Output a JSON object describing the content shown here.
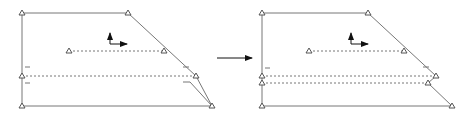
{
  "diagram": {
    "type": "geometry-transformation",
    "colors": {
      "outline": "#777777",
      "dotted": "#777777",
      "arrow": "#111111",
      "marker": "#555555",
      "background": "#ffffff"
    },
    "panels": [
      {
        "name": "before",
        "outline": [
          [
            22,
            13
          ],
          [
            128,
            13
          ],
          [
            196,
            76
          ],
          [
            212,
            106
          ],
          [
            22,
            106
          ],
          [
            22,
            13
          ]
        ],
        "notch": [
          [
            183,
            82
          ],
          [
            190,
            82
          ],
          [
            212,
            106
          ]
        ],
        "dotted_lines": [
          [
            [
              69,
              51
            ],
            [
              164,
              51
            ]
          ],
          [
            [
              22,
              76
            ],
            [
              196,
              76
            ]
          ]
        ],
        "markers": [
          [
            22,
            13
          ],
          [
            128,
            13
          ],
          [
            69,
            51
          ],
          [
            164,
            51
          ],
          [
            22,
            76
          ],
          [
            196,
            76
          ],
          [
            212,
            106
          ],
          [
            22,
            106
          ]
        ],
        "ticks": [
          [
            [
              25,
              67
            ],
            [
              30,
              67
            ]
          ],
          [
            [
              25,
              83
            ],
            [
              30,
              83
            ]
          ],
          [
            [
              183,
              67
            ],
            [
              189,
              67
            ]
          ]
        ],
        "axes_origin": [
          110,
          44
        ]
      },
      {
        "name": "after",
        "outline": [
          [
            262,
            13
          ],
          [
            368,
            13
          ],
          [
            436,
            76
          ],
          [
            428,
            83
          ],
          [
            452,
            106
          ],
          [
            262,
            106
          ],
          [
            262,
            13
          ]
        ],
        "dotted_lines": [
          [
            [
              309,
              51
            ],
            [
              404,
              51
            ]
          ],
          [
            [
              262,
              76
            ],
            [
              436,
              76
            ]
          ],
          [
            [
              262,
              83
            ],
            [
              428,
              83
            ]
          ]
        ],
        "markers": [
          [
            262,
            13
          ],
          [
            368,
            13
          ],
          [
            309,
            51
          ],
          [
            404,
            51
          ],
          [
            262,
            76
          ],
          [
            436,
            76
          ],
          [
            262,
            83
          ],
          [
            428,
            83
          ],
          [
            452,
            106
          ],
          [
            262,
            106
          ]
        ],
        "ticks": [
          [
            [
              265,
              68
            ],
            [
              270,
              68
            ]
          ],
          [
            [
              423,
              67
            ],
            [
              429,
              67
            ]
          ]
        ],
        "axes_origin": [
          351,
          44
        ]
      }
    ],
    "transition_arrow": {
      "from": [
        217,
        58
      ],
      "to": [
        252,
        58
      ]
    }
  }
}
